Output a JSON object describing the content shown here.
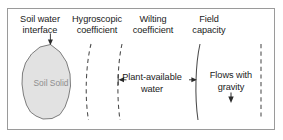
{
  "figure": {
    "type": "soil-water-retention-diagram",
    "frame": {
      "border_color": "#9a9a9a"
    },
    "labels": {
      "soil_water_interface": {
        "line1": "Soil water",
        "line2": "interface"
      },
      "hygroscopic_coefficient": {
        "line1": "Hygroscopic",
        "line2": "coefficient"
      },
      "wilting_coefficient": {
        "line1": "Wilting",
        "line2": "coefficient"
      },
      "field_capacity": {
        "line1": "Field",
        "line2": "capacity"
      },
      "plant_available_water": {
        "line1": "Plant-available",
        "line2": "water"
      },
      "flows_with_gravity": {
        "line1": "Flows with",
        "line2": "gravity"
      },
      "soil_solid": "Soil Solid"
    },
    "soil_solid": {
      "fill_color": "#e2e2e2",
      "stroke_color": "#6f6f6f",
      "label_color": "#8e8e8e"
    },
    "boundaries": [
      {
        "name": "hygroscopic-coefficient-line",
        "style": "dashed",
        "x_top": 91,
        "x_bottom": 85
      },
      {
        "name": "wilting-coefficient-line",
        "style": "dashed",
        "x_top": 122,
        "x_bottom": 118
      },
      {
        "name": "field-capacity-line",
        "style": "solid",
        "x_top": 200,
        "x_bottom": 196
      },
      {
        "name": "outer-boundary-line",
        "style": "dashed",
        "x_top": 261,
        "x_bottom": 261
      }
    ],
    "arrows": [
      {
        "name": "interface-pointer-arrow",
        "direction": "down"
      },
      {
        "name": "plant-available-left-arrow",
        "direction": "left"
      },
      {
        "name": "plant-available-right-arrow",
        "direction": "right"
      },
      {
        "name": "gravity-down-arrow",
        "direction": "down"
      }
    ],
    "colors": {
      "text": "#1a1a1a",
      "line": "#4a4a4a",
      "background": "#ffffff"
    }
  }
}
